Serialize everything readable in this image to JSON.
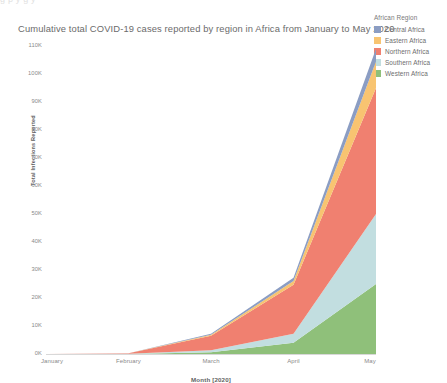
{
  "top_bleed_text": "g                p                                   y                g                                                                                   y",
  "chart_title": "Cumulative total COVID-19 cases reported by region in Africa from January to May 2020",
  "legend": {
    "title": "African Region",
    "items": [
      {
        "label": "Central Africa",
        "color": "#8b9dc3"
      },
      {
        "label": "Eastern Africa",
        "color": "#f8c471"
      },
      {
        "label": "Northern Africa",
        "color": "#f08070"
      },
      {
        "label": "Southern Africa",
        "color": "#c2dee0"
      },
      {
        "label": "Western Africa",
        "color": "#8fc07a"
      }
    ]
  },
  "axes": {
    "y_title": "Total Infections Reported",
    "x_title": "Month [2020]",
    "y_ticks": [
      "110K",
      "100K",
      "90K",
      "80K",
      "70K",
      "60K",
      "50K",
      "40K",
      "30K",
      "20K",
      "10K",
      "0K"
    ],
    "x_ticks": [
      "January",
      "February",
      "March",
      "April",
      "May"
    ]
  },
  "chart_data": {
    "type": "area",
    "stacked": true,
    "title": "Cumulative total COVID-19 cases reported by region in Africa from January to May 2020",
    "xlabel": "Month [2020]",
    "ylabel": "Total Infections Reported",
    "categories": [
      "January",
      "February",
      "March",
      "April",
      "May"
    ],
    "ylim": [
      0,
      110000
    ],
    "ytick_values": [
      0,
      10000,
      20000,
      30000,
      40000,
      50000,
      60000,
      70000,
      80000,
      90000,
      100000,
      110000
    ],
    "grid": false,
    "legend_position": "right",
    "legend_title": "African Region",
    "stack_order_bottom_to_top": [
      "Western Africa",
      "Southern Africa",
      "Northern Africa",
      "Eastern Africa",
      "Central Africa"
    ],
    "series": [
      {
        "name": "Central Africa",
        "color": "#8b9dc3",
        "values": [
          0,
          20,
          300,
          1100,
          4500
        ]
      },
      {
        "name": "Eastern Africa",
        "color": "#f8c471",
        "values": [
          0,
          30,
          400,
          1400,
          9500
        ]
      },
      {
        "name": "Northern Africa",
        "color": "#f08070",
        "values": [
          0,
          200,
          5200,
          17500,
          45000
        ]
      },
      {
        "name": "Southern Africa",
        "color": "#c2dee0",
        "values": [
          0,
          30,
          700,
          3200,
          25000
        ]
      },
      {
        "name": "Western Africa",
        "color": "#8fc07a",
        "values": [
          0,
          20,
          600,
          4000,
          25000
        ]
      }
    ],
    "totals": [
      0,
      300,
      7200,
      27200,
      109000
    ]
  }
}
